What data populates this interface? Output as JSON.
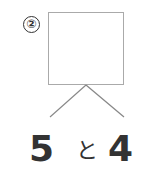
{
  "problem": {
    "number_label": "②",
    "box_value": "",
    "parts": {
      "left": "5",
      "conjunction": "と",
      "right": "4"
    }
  },
  "colors": {
    "text": "#333333",
    "box_border": "#aaaaaa",
    "line": "#888888"
  }
}
